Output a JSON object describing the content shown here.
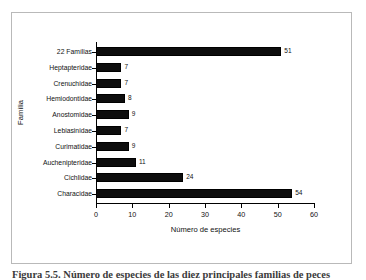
{
  "figure": {
    "caption": "Figura 5.5. Número de especies de las diez principales familias de peces"
  },
  "chart_data": {
    "type": "bar",
    "orientation": "horizontal",
    "title": "",
    "xlabel": "Número de especies",
    "ylabel": "Família",
    "categories": [
      "Characidae",
      "Cichlidae",
      "Auchenipteridae",
      "Curimatidae",
      "Lebiasinidae",
      "Anostomidae",
      "Hemiodontidae",
      "Crenuchidae",
      "Heptapteridae",
      "22 Famílias"
    ],
    "values": [
      54,
      24,
      11,
      9,
      7,
      9,
      8,
      7,
      7,
      51
    ],
    "xlim": [
      0,
      60
    ],
    "xticks": [
      0,
      10,
      20,
      30,
      40,
      50,
      60
    ],
    "xtick_labels": [
      "0",
      "10",
      "20",
      "30",
      "40",
      "50",
      "60"
    ],
    "grid": false,
    "legend": null,
    "bar_color": "#0d0d0d",
    "axis_color": "#000000",
    "data_labels": [
      "54",
      "24",
      "11",
      "9",
      "7",
      "9",
      "8",
      "7",
      "7",
      "51"
    ]
  }
}
